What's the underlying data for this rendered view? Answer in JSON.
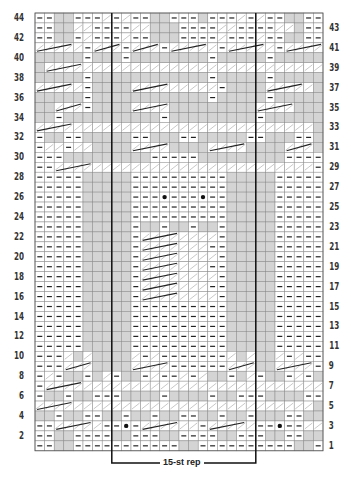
{
  "chart_data": {
    "type": "table",
    "columns": 30,
    "rows": 44,
    "repeat": {
      "label": "15-st rep",
      "start_col": 8,
      "end_col": 23
    },
    "row_labels_left": [
      "44",
      "42",
      "40",
      "38",
      "36",
      "34",
      "32",
      "30",
      "28",
      "26",
      "24",
      "22",
      "20",
      "18",
      "16",
      "14",
      "12",
      "10",
      "8",
      "6",
      "4",
      "2"
    ],
    "row_labels_right": [
      "43",
      "41",
      "39",
      "37",
      "35",
      "33",
      "31",
      "29",
      "27",
      "25",
      "23",
      "21",
      "19",
      "17",
      "15",
      "13",
      "11",
      "9",
      "7",
      "5",
      "3",
      "1"
    ],
    "legend_symbols": {
      "-": "purl",
      "G": "shaded (no stitch / knit)",
      ".": "knit",
      "o": "bobble",
      "c": "cable stitch"
    },
    "grid": [
      "--GG---c-c--GG---G---c-c--GG--",
      "--GGcc----ccGGG----cc----ccG--",
      "--GG-c---c--GGG----c---c--GG--",
      "ccccc-ccc-ccc-ccccc-ccccc-cccc",
      "GGGGG-GGG-GGGGGGGG-GGGGG-GGGGG",
      "GcccccccccccccccccccccccccccccG",
      "GGGGG-GGGGGGGGGGGG-GGGGG-GGGGG",
      "ccccc-GGGGccccccccc-GGGGccccc",
      "GGGGG-GGGGGGGGGGGG-GGGGG-GGGGG",
      "GGccc-GGGGccccGGGGGGGGGccccGG",
      "GG-GGGGGGGGGG-GGGGGGGGG-GGGGG",
      "ccccccccccccccccccccccccccccc",
      "-GG--GGGGG--GGG--GGGGG--GGG--",
      "-cc-ccGGGGccccGGGGccccGGGGccc",
      "---GGGGGGGGG-----GGGGGGGGG----",
      "--ccccccccccccccccccccccccccc-",
      "-----GGGGG----------GGGGG-----",
      "-----GGGGG----------GGGGG-----",
      "-----GGGGG---o---o--GGGGG-----",
      "-----GGGGG----------GGGGG-----",
      "-----GGGGG----------GGGGG-----",
      "-----GGGGG-GG-GG-GG-GGGGG-----",
      "-----GGGGG-cccccccc-GGGGG-----",
      "-----GGGGG-ccccccc--GGGGG-----",
      "-----GGGGG-cccccccc-GGGGG-----",
      "-----GGGGG-ccccccc--GGGGG-----",
      "-----GGGGG-cccccccc-GGGGG-----",
      "-----GGGGG-ccccccc--GGGGG-----",
      "-----GGGGG-cccccccc-GGGGG-----",
      "-----GGGGG----------GGGGG-----",
      "-----GGGGG----------GGGGG-----",
      "-----GGGGG----------GGGGG-----",
      "-----GGGGG----------GGGGG-----",
      "-----GGGGG----------GGGGG-----",
      "---cGcGGGGc-c-------cGcGGc-c--",
      "---cccGGGGcccc------cccGGcccc-",
      "-c-GG-Gc-GG-c--c-cGG-Gc-GG-c-",
      "-ccccccccccccccccccccccccccccc",
      "-GG-GG---GGGG-GGGG-GG---GGGG--",
      "ccccccccccccccccccccccccccccc",
      "GG-GG--GG-GG-GG--GG-GG-GGG--G",
      "--ccccc--o-cccccc-ccccc--o--cc",
      "--GG----GG---GG----GG---GG--",
      "--GG-----------GG----------GG--"
    ]
  },
  "rep_label": "15-st rep"
}
